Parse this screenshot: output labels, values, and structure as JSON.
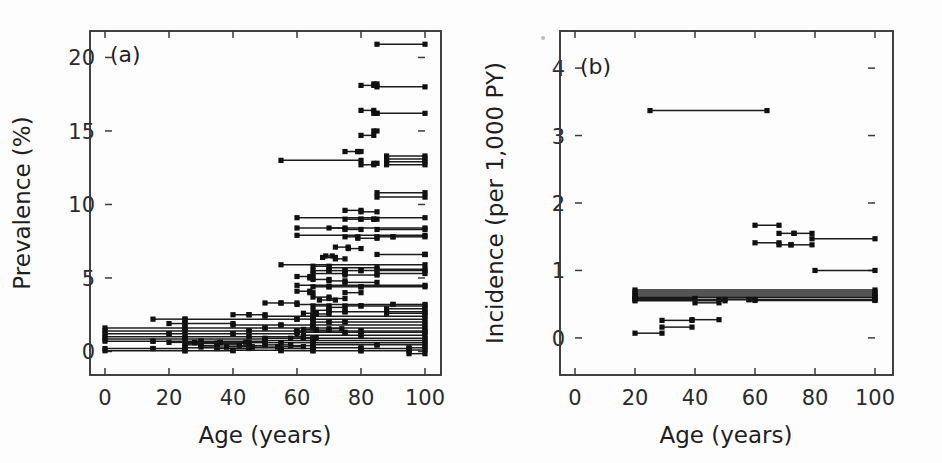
{
  "figure": {
    "background": "#fdfdfd",
    "ink": "#1b1b1b",
    "width": 942,
    "height": 463
  },
  "panels": {
    "a": {
      "tag": "(a)",
      "xlabel": "Age (years)",
      "ylabel": "Prevalence (%)",
      "xticks": [
        0,
        20,
        40,
        60,
        80,
        100
      ],
      "yticks": [
        0,
        5,
        10,
        15,
        20
      ],
      "xlim": [
        0,
        100
      ],
      "ylim": [
        -1.6,
        21.8
      ]
    },
    "b": {
      "tag": "(b)",
      "xlabel": "Age (years)",
      "ylabel": "Incidence (per 1,000 PY)",
      "xticks": [
        0,
        20,
        40,
        60,
        80,
        100
      ],
      "yticks": [
        0,
        1,
        2,
        3,
        4
      ],
      "xlim": [
        0,
        100
      ],
      "ylim": [
        -0.55,
        4.55
      ]
    }
  },
  "chart_data": [
    {
      "type": "line",
      "id": "panel-a",
      "title": "(a)",
      "xlabel": "Age (years)",
      "ylabel": "Prevalence (%)",
      "xlim": [
        0,
        100
      ],
      "ylim": [
        -1.6,
        21.8
      ],
      "xticks": [
        0,
        20,
        40,
        60,
        80,
        100
      ],
      "yticks": [
        0,
        5,
        10,
        15,
        20
      ],
      "grid": false,
      "legend": null,
      "description": "Age-specific prevalence estimates plotted as horizontal segments spanning each reported age band, with square markers at the band endpoints.",
      "segments": [
        [
          85,
          100,
          20.9
        ],
        [
          80,
          84,
          18.1
        ],
        [
          84,
          85,
          18.2
        ],
        [
          85,
          100,
          18.0
        ],
        [
          80,
          84,
          16.4
        ],
        [
          84,
          85,
          16.2
        ],
        [
          85,
          100,
          16.2
        ],
        [
          80,
          84,
          14.7
        ],
        [
          84,
          85,
          15.0
        ],
        [
          75,
          79,
          13.6
        ],
        [
          79,
          80,
          13.6
        ],
        [
          55,
          80,
          13.0
        ],
        [
          80,
          84,
          12.7
        ],
        [
          84,
          85,
          12.8
        ],
        [
          88,
          100,
          13.3
        ],
        [
          88,
          100,
          13.1
        ],
        [
          88,
          100,
          12.9
        ],
        [
          88,
          100,
          12.7
        ],
        [
          85,
          100,
          10.8
        ],
        [
          85,
          100,
          10.5
        ],
        [
          75,
          80,
          9.6
        ],
        [
          80,
          85,
          9.5
        ],
        [
          60,
          100,
          9.1
        ],
        [
          75,
          80,
          9.0
        ],
        [
          80,
          84,
          9.0
        ],
        [
          84,
          85,
          9.0
        ],
        [
          60,
          100,
          8.4
        ],
        [
          70,
          75,
          8.4
        ],
        [
          75,
          80,
          8.3
        ],
        [
          85,
          100,
          8.3
        ],
        [
          60,
          100,
          7.9
        ],
        [
          75,
          79,
          7.8
        ],
        [
          79,
          85,
          7.7
        ],
        [
          85,
          90,
          7.8
        ],
        [
          90,
          100,
          7.8
        ],
        [
          72,
          76,
          7.1
        ],
        [
          76,
          80,
          7.0
        ],
        [
          85,
          100,
          6.6
        ],
        [
          100,
          100,
          6.6
        ],
        [
          68,
          72,
          6.4
        ],
        [
          72,
          75,
          6.3
        ],
        [
          69,
          71,
          6.5
        ],
        [
          55,
          100,
          5.9
        ],
        [
          65,
          70,
          5.8
        ],
        [
          70,
          85,
          5.7
        ],
        [
          85,
          100,
          5.6
        ],
        [
          65,
          70,
          5.5
        ],
        [
          70,
          75,
          5.5
        ],
        [
          75,
          80,
          5.5
        ],
        [
          80,
          100,
          5.5
        ],
        [
          65,
          75,
          5.3
        ],
        [
          75,
          85,
          5.2
        ],
        [
          85,
          100,
          5.3
        ],
        [
          60,
          64,
          5.1
        ],
        [
          64,
          65,
          5.0
        ],
        [
          65,
          70,
          4.9
        ],
        [
          70,
          75,
          4.8
        ],
        [
          75,
          85,
          4.7
        ],
        [
          60,
          100,
          4.5
        ],
        [
          65,
          70,
          4.4
        ],
        [
          70,
          80,
          4.4
        ],
        [
          80,
          100,
          4.4
        ],
        [
          60,
          64,
          4.1
        ],
        [
          64,
          65,
          4.0
        ],
        [
          75,
          80,
          4.0
        ],
        [
          65,
          70,
          3.7
        ],
        [
          70,
          75,
          3.6
        ],
        [
          67,
          72,
          3.5
        ],
        [
          50,
          55,
          3.3
        ],
        [
          55,
          60,
          3.3
        ],
        [
          60,
          90,
          3.2
        ],
        [
          90,
          100,
          3.2
        ],
        [
          65,
          70,
          3.1
        ],
        [
          70,
          75,
          3.0
        ],
        [
          75,
          80,
          3.1
        ],
        [
          80,
          100,
          3.1
        ],
        [
          65,
          70,
          2.8
        ],
        [
          70,
          75,
          2.7
        ],
        [
          75,
          100,
          2.7
        ],
        [
          40,
          45,
          2.5
        ],
        [
          45,
          50,
          2.5
        ],
        [
          50,
          65,
          2.4
        ],
        [
          65,
          100,
          2.4
        ],
        [
          15,
          25,
          2.2
        ],
        [
          25,
          60,
          2.2
        ],
        [
          60,
          65,
          2.2
        ],
        [
          65,
          100,
          2.2
        ],
        [
          65,
          70,
          2.0
        ],
        [
          70,
          75,
          2.0
        ],
        [
          75,
          100,
          2.0
        ],
        [
          20,
          25,
          1.9
        ],
        [
          25,
          40,
          1.9
        ],
        [
          40,
          55,
          1.8
        ],
        [
          55,
          65,
          1.8
        ],
        [
          65,
          100,
          1.8
        ],
        [
          0,
          25,
          1.6
        ],
        [
          25,
          50,
          1.6
        ],
        [
          50,
          65,
          1.6
        ],
        [
          65,
          100,
          1.6
        ],
        [
          0,
          25,
          1.4
        ],
        [
          25,
          45,
          1.4
        ],
        [
          45,
          60,
          1.4
        ],
        [
          60,
          80,
          1.4
        ],
        [
          80,
          100,
          1.4
        ],
        [
          0,
          20,
          1.2
        ],
        [
          20,
          40,
          1.2
        ],
        [
          40,
          60,
          1.2
        ],
        [
          60,
          75,
          1.3
        ],
        [
          75,
          100,
          1.3
        ],
        [
          0,
          25,
          1.0
        ],
        [
          25,
          45,
          1.0
        ],
        [
          45,
          62,
          1.0
        ],
        [
          62,
          80,
          1.1
        ],
        [
          80,
          100,
          1.1
        ],
        [
          0,
          25,
          0.85
        ],
        [
          25,
          50,
          0.85
        ],
        [
          50,
          65,
          0.9
        ],
        [
          65,
          100,
          0.9
        ],
        [
          0,
          15,
          0.7
        ],
        [
          15,
          30,
          0.7
        ],
        [
          30,
          50,
          0.7
        ],
        [
          50,
          65,
          0.75
        ],
        [
          65,
          100,
          0.75
        ],
        [
          25,
          35,
          0.55
        ],
        [
          35,
          45,
          0.55
        ],
        [
          45,
          55,
          0.6
        ],
        [
          55,
          65,
          0.6
        ],
        [
          65,
          100,
          0.6
        ],
        [
          25,
          30,
          0.45
        ],
        [
          30,
          35,
          0.4
        ],
        [
          35,
          42,
          0.45
        ],
        [
          42,
          50,
          0.4
        ],
        [
          50,
          58,
          0.45
        ],
        [
          58,
          65,
          0.4
        ],
        [
          65,
          85,
          0.45
        ],
        [
          85,
          100,
          0.45
        ],
        [
          0,
          15,
          0.2
        ],
        [
          15,
          25,
          0.2
        ],
        [
          25,
          35,
          0.25
        ],
        [
          35,
          45,
          0.2
        ],
        [
          45,
          55,
          0.25
        ],
        [
          55,
          65,
          0.2
        ],
        [
          65,
          80,
          0.25
        ],
        [
          80,
          95,
          0.2
        ],
        [
          95,
          100,
          0.25
        ],
        [
          0,
          25,
          0.05
        ],
        [
          25,
          40,
          0.05
        ],
        [
          40,
          55,
          0.08
        ],
        [
          55,
          65,
          0.05
        ],
        [
          65,
          80,
          0.05
        ],
        [
          80,
          95,
          0.05
        ],
        [
          95,
          100,
          0.1
        ],
        [
          30,
          38,
          0.3
        ],
        [
          38,
          46,
          0.32
        ],
        [
          46,
          54,
          0.3
        ],
        [
          54,
          62,
          0.33
        ],
        [
          20,
          28,
          0.62
        ],
        [
          28,
          36,
          0.6
        ],
        [
          36,
          44,
          0.63
        ],
        [
          62,
          66,
          1.5
        ],
        [
          66,
          70,
          1.45
        ],
        [
          70,
          74,
          1.55
        ],
        [
          62,
          66,
          2.6
        ],
        [
          66,
          70,
          2.55
        ],
        [
          58,
          62,
          0.9
        ],
        [
          62,
          66,
          0.95
        ],
        [
          88,
          100,
          2.6
        ],
        [
          88,
          100,
          2.9
        ],
        [
          95,
          100,
          -0.15
        ]
      ]
    },
    {
      "type": "line",
      "id": "panel-b",
      "title": "(b)",
      "xlabel": "Age (years)",
      "ylabel": "Incidence (per 1,000 PY)",
      "xlim": [
        0,
        100
      ],
      "ylim": [
        -0.55,
        4.55
      ],
      "xticks": [
        0,
        20,
        40,
        60,
        80,
        100
      ],
      "yticks": [
        0,
        1,
        2,
        3,
        4
      ],
      "grid": false,
      "legend": null,
      "description": "Age-specific incidence rates plotted as horizontal segments spanning each reported age band, with square markers at the band endpoints.",
      "segments": [
        [
          25,
          64,
          3.37
        ],
        [
          60,
          68,
          1.67
        ],
        [
          68,
          73,
          1.55
        ],
        [
          73,
          79,
          1.55
        ],
        [
          60,
          68,
          1.41
        ],
        [
          68,
          72,
          1.38
        ],
        [
          72,
          79,
          1.38
        ],
        [
          79,
          100,
          1.47
        ],
        [
          80,
          100,
          1.0
        ],
        [
          20,
          100,
          0.71
        ],
        [
          20,
          100,
          0.68
        ],
        [
          20,
          100,
          0.65
        ],
        [
          20,
          100,
          0.62
        ],
        [
          20,
          100,
          0.6
        ],
        [
          20,
          100,
          0.57
        ],
        [
          20,
          40,
          0.585
        ],
        [
          40,
          48,
          0.52
        ],
        [
          48,
          58,
          0.57
        ],
        [
          58,
          100,
          0.565
        ],
        [
          20,
          50,
          0.55
        ],
        [
          50,
          60,
          0.57
        ],
        [
          60,
          100,
          0.555
        ],
        [
          29,
          39,
          0.26
        ],
        [
          39,
          48,
          0.27
        ],
        [
          29,
          39,
          0.16
        ],
        [
          20,
          29,
          0.07
        ]
      ]
    }
  ]
}
